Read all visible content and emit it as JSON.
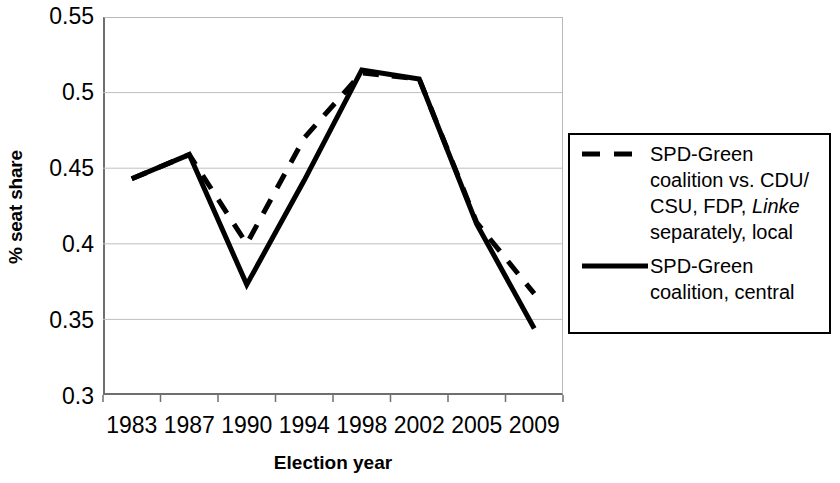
{
  "chart_data": {
    "type": "line",
    "title": "",
    "subtitle": "",
    "xlabel": "Election year",
    "ylabel": "% seat share",
    "categories": [
      "1983",
      "1987",
      "1990",
      "1994",
      "1998",
      "2002",
      "2005",
      "2009"
    ],
    "x": [
      1983,
      1987,
      1990,
      1994,
      1998,
      2002,
      2005,
      2009
    ],
    "ylim": [
      0.3,
      0.55
    ],
    "yticks": [
      0.3,
      0.35,
      0.4,
      0.45,
      0.5,
      0.55
    ],
    "ytick_labels": [
      "0.3",
      "0.35",
      "0.4",
      "0.45",
      "0.5",
      "0.55"
    ],
    "grid": "horizontal",
    "legend_position": "right-outside",
    "series": [
      {
        "name": "SPD-Green coalition vs. CDU/CSU, FDP, Linke separately, local",
        "style": "dashed",
        "color": "#000000",
        "values": [
          0.443,
          0.459,
          0.4,
          0.47,
          0.513,
          0.509,
          0.414,
          0.367
        ]
      },
      {
        "name": "SPD-Green coalition, central",
        "style": "solid",
        "color": "#000000",
        "values": [
          0.443,
          0.459,
          0.373,
          0.442,
          0.515,
          0.509,
          0.413,
          0.344
        ]
      }
    ]
  },
  "axes": {
    "y_title": "% seat share",
    "x_title": "Election year",
    "y_tick_labels": [
      "0.55",
      "0.5",
      "0.45",
      "0.4",
      "0.35",
      "0.3"
    ],
    "x_tick_labels": [
      "1983",
      "1987",
      "1990",
      "1994",
      "1998",
      "2002",
      "2005",
      "2009"
    ]
  },
  "legend": {
    "entries": [
      {
        "style": "dashed",
        "line1": "SPD-Green",
        "line2": "coalition vs. CDU/",
        "line3_pre": "CSU, FDP, ",
        "line3_italic": "Linke",
        "line4": "separately, local"
      },
      {
        "style": "solid",
        "line1": "SPD-Green",
        "line2": "coalition, central"
      }
    ]
  },
  "colors": {
    "line": "#000000",
    "grid": "#bfbfbf",
    "axis": "#6f6f6f",
    "legend_border": "#000000",
    "background": "#ffffff"
  }
}
